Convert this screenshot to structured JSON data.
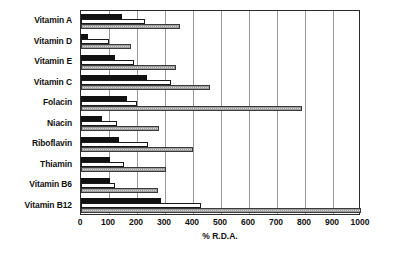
{
  "chart_data": {
    "type": "bar",
    "orientation": "horizontal",
    "title": "",
    "xlabel": "% R.D.A.",
    "ylabel": "",
    "xlim": [
      0,
      1000
    ],
    "xticks": [
      0,
      100,
      200,
      300,
      400,
      500,
      600,
      700,
      800,
      900,
      1000
    ],
    "grid": true,
    "legend_position": "none",
    "categories": [
      "Vitamin A",
      "Vitamin D",
      "Vitamin E",
      "Vitamin C",
      "Folacin",
      "Niacin",
      "Riboflavin",
      "Thiamin",
      "Vitamin B6",
      "Vitamin B12"
    ],
    "series": [
      {
        "name": "series-1",
        "fill": "black",
        "color": "#111111",
        "values": [
          145,
          25,
          120,
          235,
          165,
          75,
          135,
          105,
          105,
          285
        ]
      },
      {
        "name": "series-2",
        "fill": "white",
        "color": "#ffffff",
        "values": [
          230,
          100,
          190,
          320,
          200,
          130,
          240,
          155,
          120,
          430
        ]
      },
      {
        "name": "series-3",
        "fill": "stippled-gray",
        "color": "#d9d9d9",
        "values": [
          355,
          180,
          340,
          460,
          790,
          280,
          400,
          305,
          275,
          1000
        ]
      }
    ]
  }
}
